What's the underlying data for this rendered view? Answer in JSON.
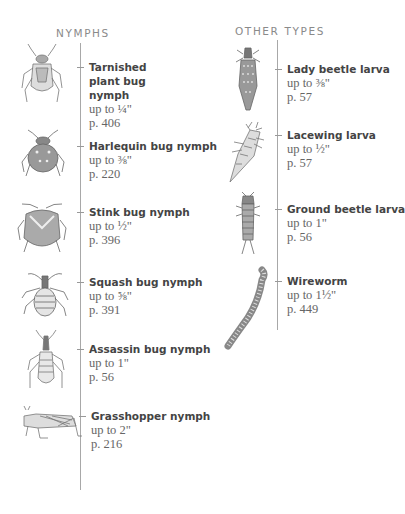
{
  "nymphs": {
    "heading": "NYMPHS",
    "entries": [
      {
        "name": "Tarnished plant bug nymph",
        "size": "up to ¼\"",
        "page": "p. 406",
        "icon": "tarnished-plant-bug-nymph-illustration"
      },
      {
        "name": "Harlequin bug nymph",
        "size": "up to ⅜\"",
        "page": "p. 220",
        "icon": "harlequin-bug-nymph-illustration"
      },
      {
        "name": "Stink bug nymph",
        "size": "up to ½\"",
        "page": "p. 396",
        "icon": "stink-bug-nymph-illustration"
      },
      {
        "name": "Squash bug nymph",
        "size": "up to ⅝\"",
        "page": "p. 391",
        "icon": "squash-bug-nymph-illustration"
      },
      {
        "name": "Assassin bug nymph",
        "size": "up to 1\"",
        "page": "p. 56",
        "icon": "assassin-bug-nymph-illustration"
      },
      {
        "name": "Grasshopper nymph",
        "size": "up to 2\"",
        "page": "p. 216",
        "icon": "grasshopper-nymph-illustration"
      }
    ]
  },
  "other_types": {
    "heading": "OTHER TYPES",
    "entries": [
      {
        "name": "Lady beetle larva",
        "size": "up to ⅜\"",
        "page": "p. 57",
        "icon": "lady-beetle-larva-illustration"
      },
      {
        "name": "Lacewing larva",
        "size": "up to ½\"",
        "page": "p. 57",
        "icon": "lacewing-larva-illustration"
      },
      {
        "name": "Ground beetle larva",
        "size": "up to 1\"",
        "page": "p. 56",
        "icon": "ground-beetle-larva-illustration"
      },
      {
        "name": "Wireworm",
        "size": "up to 1½\"",
        "page": "p. 449",
        "icon": "wireworm-illustration"
      }
    ]
  }
}
